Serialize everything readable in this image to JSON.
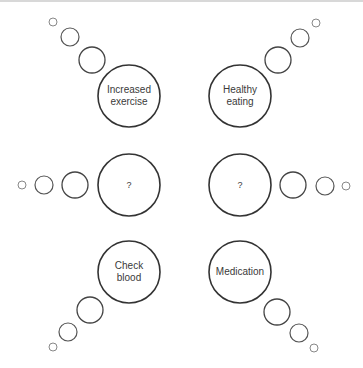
{
  "diagram": {
    "type": "thought-bubble-mindmap",
    "colors": {
      "big_stroke": "#333333",
      "small_stroke": "#555555",
      "tiny_stroke": "#888888",
      "text": "#3a3a3a"
    },
    "bubbles": [
      {
        "id": "increased-exercise",
        "line1": "Increased",
        "line2": "exercise",
        "cx": 129,
        "cy": 96,
        "r": 31,
        "trail": [
          {
            "cx": 92,
            "cy": 60,
            "r": 13
          },
          {
            "cx": 70,
            "cy": 37,
            "r": 9
          },
          {
            "cx": 53,
            "cy": 22,
            "r": 4
          }
        ]
      },
      {
        "id": "healthy-eating",
        "line1": "Healthy",
        "line2": "eating",
        "cx": 240,
        "cy": 96,
        "r": 31,
        "trail": [
          {
            "cx": 278,
            "cy": 60,
            "r": 13
          },
          {
            "cx": 300,
            "cy": 38,
            "r": 9
          },
          {
            "cx": 316,
            "cy": 23,
            "r": 4
          }
        ]
      },
      {
        "id": "unknown-left",
        "line1": "?",
        "line2": "",
        "cx": 129,
        "cy": 185,
        "r": 31,
        "trail": [
          {
            "cx": 75,
            "cy": 185,
            "r": 13
          },
          {
            "cx": 44,
            "cy": 185,
            "r": 9
          },
          {
            "cx": 22,
            "cy": 185,
            "r": 4
          }
        ]
      },
      {
        "id": "unknown-right",
        "line1": "?",
        "line2": "",
        "cx": 240,
        "cy": 185,
        "r": 31,
        "trail": [
          {
            "cx": 293,
            "cy": 185,
            "r": 13
          },
          {
            "cx": 325,
            "cy": 186,
            "r": 9
          },
          {
            "cx": 346,
            "cy": 186,
            "r": 4
          }
        ]
      },
      {
        "id": "check-blood",
        "line1": "Check",
        "line2": "blood",
        "cx": 129,
        "cy": 272,
        "r": 31,
        "trail": [
          {
            "cx": 90,
            "cy": 310,
            "r": 13
          },
          {
            "cx": 68,
            "cy": 332,
            "r": 9
          },
          {
            "cx": 53,
            "cy": 347,
            "r": 4
          }
        ]
      },
      {
        "id": "medication",
        "line1": "Medication",
        "line2": "",
        "cx": 240,
        "cy": 272,
        "r": 31,
        "trail": [
          {
            "cx": 277,
            "cy": 312,
            "r": 13
          },
          {
            "cx": 299,
            "cy": 333,
            "r": 9
          },
          {
            "cx": 314,
            "cy": 348,
            "r": 4
          }
        ]
      }
    ]
  }
}
